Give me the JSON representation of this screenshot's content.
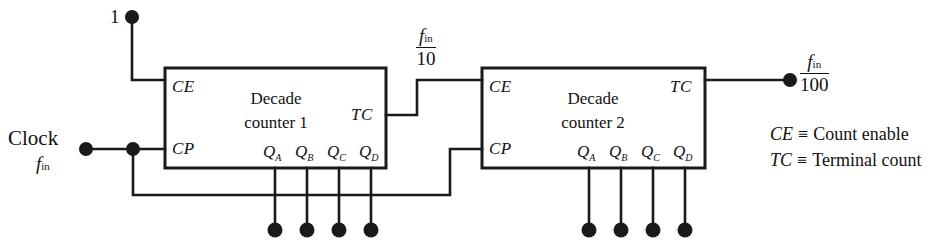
{
  "diagram": {
    "stroke_color": "#1a1a1a",
    "background_color": "#ffffff"
  },
  "inputs": {
    "logic_one_label": "1",
    "clock_label": "Clock",
    "clock_freq_symbol": "f",
    "clock_freq_subscript": "in"
  },
  "counters": [
    {
      "id": "counter-1",
      "title_line1": "Decade",
      "title_line2": "counter 1",
      "pin_ce": "CE",
      "pin_cp": "CP",
      "pin_tc": "TC",
      "outputs": [
        {
          "name": "Q",
          "sub": "A"
        },
        {
          "name": "Q",
          "sub": "B"
        },
        {
          "name": "Q",
          "sub": "C"
        },
        {
          "name": "Q",
          "sub": "D"
        }
      ]
    },
    {
      "id": "counter-2",
      "title_line1": "Decade",
      "title_line2": "counter 2",
      "pin_ce": "CE",
      "pin_cp": "CP",
      "pin_tc": "TC",
      "outputs": [
        {
          "name": "Q",
          "sub": "A"
        },
        {
          "name": "Q",
          "sub": "B"
        },
        {
          "name": "Q",
          "sub": "C"
        },
        {
          "name": "Q",
          "sub": "D"
        }
      ]
    }
  ],
  "signals": {
    "divide_by_10": {
      "numerator_symbol": "f",
      "numerator_subscript": "in",
      "denominator": "10"
    },
    "divide_by_100": {
      "numerator_symbol": "f",
      "numerator_subscript": "in",
      "denominator": "100"
    }
  },
  "legend": [
    {
      "symbol": "CE",
      "equiv": "≡",
      "meaning": "Count enable"
    },
    {
      "symbol": "TC",
      "equiv": "≡",
      "meaning": "Terminal count"
    }
  ]
}
